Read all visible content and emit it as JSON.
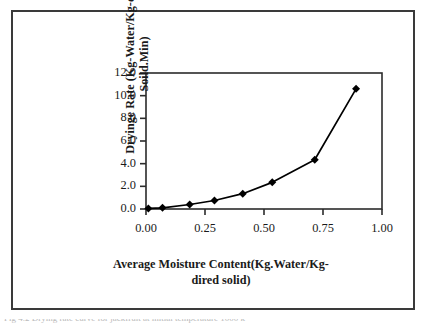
{
  "figure": {
    "border_color": "#3a3a3a",
    "background": "#ffffff",
    "caption": "Fig 4.2 Drying rate curve for jackfruit at initial temperature 1000 k"
  },
  "chart_data": {
    "type": "line",
    "title": "",
    "subtitle": "",
    "xlabel": "Average Moisture Content(Kg.Water/Kg-\ndired solid)",
    "ylabel": "Dryinge Rate (Kg-Water/Kg-dried\nSoild.Min)",
    "x": [
      0.01,
      0.07,
      0.185,
      0.29,
      0.41,
      0.535,
      0.715,
      0.89
    ],
    "y": [
      0.05,
      0.1,
      0.4,
      0.75,
      1.35,
      2.35,
      4.35,
      10.6
    ],
    "series": [
      {
        "name": "Drying rate",
        "values": [
          0.05,
          0.1,
          0.4,
          0.75,
          1.35,
          2.35,
          4.35,
          10.6
        ]
      }
    ],
    "xlim": [
      0.0,
      1.0
    ],
    "ylim": [
      0.0,
      12.0
    ],
    "xticks": [
      0.0,
      0.25,
      0.5,
      0.75,
      1.0
    ],
    "yticks": [
      0.0,
      2.0,
      4.0,
      6.0,
      8.0,
      10.0,
      12.0
    ],
    "xtick_labels": [
      "0.00",
      "0.25",
      "0.50",
      "0.75",
      "1.00"
    ],
    "ytick_labels": [
      "0.0",
      "2.0",
      "4.0",
      "6.0",
      "8.0",
      "10.0",
      "12.0"
    ],
    "grid": false,
    "legend": false,
    "legend_position": "none",
    "marker": "diamond",
    "marker_color": "#000000",
    "line_color": "#000000",
    "annotations": []
  }
}
